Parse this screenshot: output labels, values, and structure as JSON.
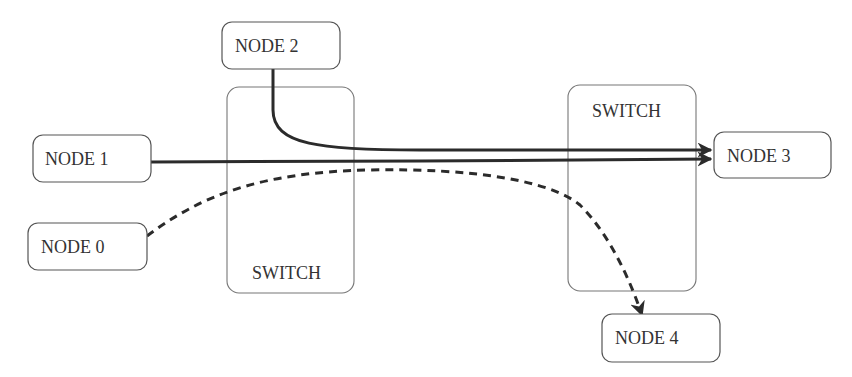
{
  "diagram": {
    "type": "network-flow",
    "nodes": [
      {
        "id": "node0",
        "label": "NODE 0"
      },
      {
        "id": "node1",
        "label": "NODE 1"
      },
      {
        "id": "node2",
        "label": "NODE 2"
      },
      {
        "id": "node3",
        "label": "NODE 3"
      },
      {
        "id": "node4",
        "label": "NODE 4"
      }
    ],
    "switches": [
      {
        "id": "switch_left",
        "label": "SWITCH"
      },
      {
        "id": "switch_right",
        "label": "SWITCH"
      }
    ],
    "flows": [
      {
        "from": "node2",
        "to": "node3",
        "style": "solid"
      },
      {
        "from": "node1",
        "to": "node3",
        "style": "solid"
      },
      {
        "from": "node0",
        "to": "node4",
        "style": "dashed"
      }
    ],
    "colors": {
      "line": "#2b2b2b",
      "box_border": "#555555",
      "switch_border": "#777777",
      "text": "#333333"
    }
  }
}
